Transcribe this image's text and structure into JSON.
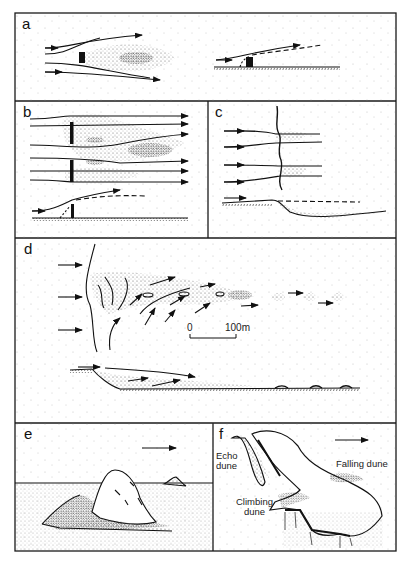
{
  "figure": {
    "panels": [
      {
        "id": "a",
        "label": "a",
        "content": "Flow around solid obstacle (plan and profile), with lee-side sand shadow"
      },
      {
        "id": "b",
        "label": "b",
        "content": "Flow through gaps between obstacles (plan and profile)"
      },
      {
        "id": "c",
        "label": "c",
        "content": "Flow over a cliff edge (plan and profile)"
      },
      {
        "id": "d",
        "label": "d",
        "content": "Sand streamer/lee dune downwind of a scarp (plan and profile)"
      },
      {
        "id": "e",
        "label": "e",
        "content": "Lee dune behind a hill"
      },
      {
        "id": "f",
        "label": "f",
        "content": "Topographically forced dunes at a plateau escarpment"
      }
    ],
    "scale_bar": {
      "start": "0",
      "end": "100m"
    },
    "annotations": {
      "echo_dune": [
        "Echo",
        "dune"
      ],
      "climbing_dune": [
        "Climbing",
        "dune"
      ],
      "falling_dune": "Falling dune"
    },
    "colors": {
      "ink": "#1a1a1a",
      "stipple": "#8a8a8a",
      "background": "#ffffff"
    }
  }
}
